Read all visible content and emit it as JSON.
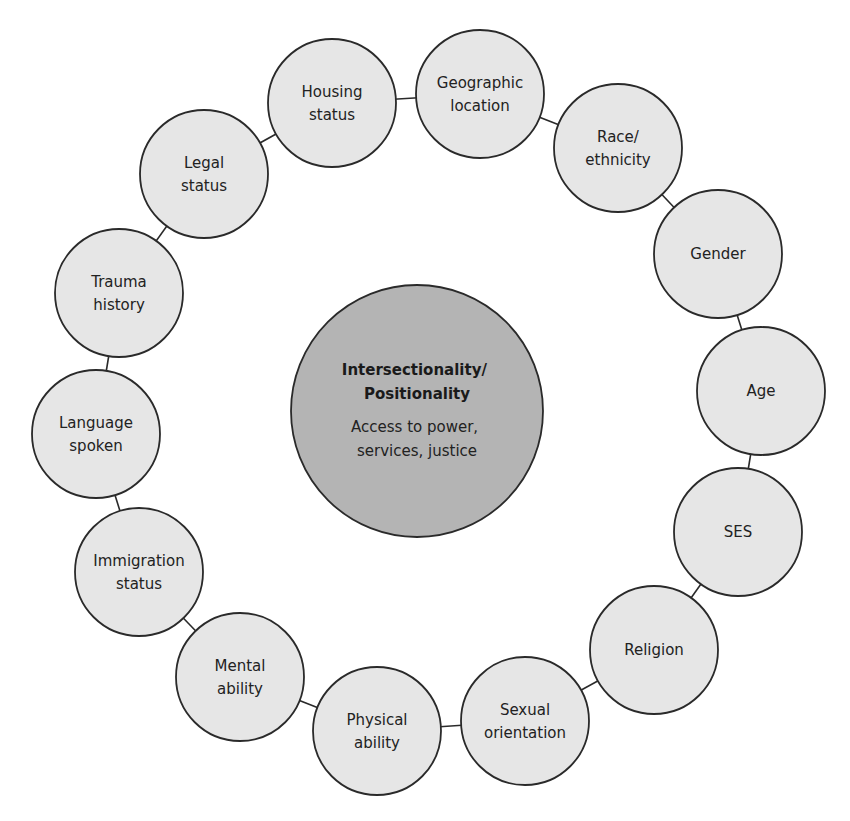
{
  "diagram": {
    "type": "hub-ring",
    "colors": {
      "node_fill": "#e6e6e6",
      "center_fill": "#b4b4b4",
      "stroke": "#2a2a2a",
      "connector": "#2a2a2a",
      "text": "#222222"
    },
    "center": {
      "cx": 417,
      "cy": 411,
      "r": 126,
      "title_lines": [
        "Intersectionality/",
        "Positionality"
      ],
      "subtitle_lines": [
        "Access to power,",
        "services, justice"
      ]
    },
    "node_radius": 64,
    "nodes": [
      {
        "id": "housing-status",
        "lines": [
          "Housing",
          "status"
        ],
        "cx": 332,
        "cy": 103
      },
      {
        "id": "geographic-location",
        "lines": [
          "Geographic",
          "location"
        ],
        "cx": 480,
        "cy": 94
      },
      {
        "id": "race-ethnicity",
        "lines": [
          "Race/",
          "ethnicity"
        ],
        "cx": 618,
        "cy": 148
      },
      {
        "id": "gender",
        "lines": [
          "Gender"
        ],
        "cx": 718,
        "cy": 254
      },
      {
        "id": "age",
        "lines": [
          "Age"
        ],
        "cx": 761,
        "cy": 391
      },
      {
        "id": "ses",
        "lines": [
          "SES"
        ],
        "cx": 738,
        "cy": 532
      },
      {
        "id": "religion",
        "lines": [
          "Religion"
        ],
        "cx": 654,
        "cy": 650
      },
      {
        "id": "sexual-orientation",
        "lines": [
          "Sexual",
          "orientation"
        ],
        "cx": 525,
        "cy": 721
      },
      {
        "id": "physical-ability",
        "lines": [
          "Physical",
          "ability"
        ],
        "cx": 377,
        "cy": 731
      },
      {
        "id": "mental-ability",
        "lines": [
          "Mental",
          "ability"
        ],
        "cx": 240,
        "cy": 677
      },
      {
        "id": "immigration-status",
        "lines": [
          "Immigration",
          "status"
        ],
        "cx": 139,
        "cy": 572
      },
      {
        "id": "language-spoken",
        "lines": [
          "Language",
          "spoken"
        ],
        "cx": 96,
        "cy": 434
      },
      {
        "id": "trauma-history",
        "lines": [
          "Trauma",
          "history"
        ],
        "cx": 119,
        "cy": 293
      },
      {
        "id": "legal-status",
        "lines": [
          "Legal",
          "status"
        ],
        "cx": 204,
        "cy": 174
      }
    ],
    "connections": [
      [
        "housing-status",
        "geographic-location"
      ],
      [
        "geographic-location",
        "race-ethnicity"
      ],
      [
        "race-ethnicity",
        "gender"
      ],
      [
        "gender",
        "age"
      ],
      [
        "age",
        "ses"
      ],
      [
        "ses",
        "religion"
      ],
      [
        "religion",
        "sexual-orientation"
      ],
      [
        "sexual-orientation",
        "physical-ability"
      ],
      [
        "physical-ability",
        "mental-ability"
      ],
      [
        "mental-ability",
        "immigration-status"
      ],
      [
        "immigration-status",
        "language-spoken"
      ],
      [
        "language-spoken",
        "trauma-history"
      ],
      [
        "trauma-history",
        "legal-status"
      ],
      [
        "legal-status",
        "housing-status"
      ]
    ]
  }
}
